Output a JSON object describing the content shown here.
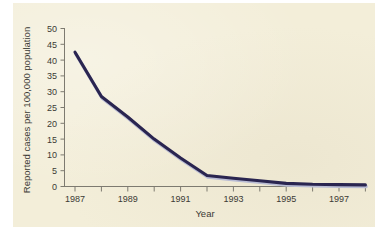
{
  "chart_data": {
    "type": "line",
    "title": "",
    "xlabel": "Year",
    "ylabel": "Reported cases per 100,000 population",
    "x": [
      1987,
      1988,
      1989,
      1990,
      1991,
      1992,
      1993,
      1994,
      1995,
      1996,
      1997,
      1998
    ],
    "values": [
      42.5,
      28.5,
      22.0,
      15.0,
      9.0,
      3.5,
      2.6,
      1.8,
      1.0,
      0.7,
      0.6,
      0.5
    ],
    "series": [
      {
        "name": "Reported cases",
        "values": [
          42.5,
          28.5,
          22.0,
          15.0,
          9.0,
          3.5,
          2.6,
          1.8,
          1.0,
          0.7,
          0.6,
          0.5
        ]
      }
    ],
    "xlim": [
      1987,
      1998
    ],
    "ylim": [
      0,
      50
    ],
    "ytick_labels": [
      "0",
      "5",
      "10",
      "15",
      "20",
      "25",
      "30",
      "35",
      "40",
      "45",
      "50"
    ],
    "ytick_values": [
      0,
      5,
      10,
      15,
      20,
      25,
      30,
      35,
      40,
      45,
      50
    ],
    "xtick_values": [
      1987,
      1988,
      1989,
      1990,
      1991,
      1992,
      1993,
      1994,
      1995,
      1996,
      1997,
      1998
    ],
    "xtick_labels": [
      "1987",
      "",
      "1989",
      "",
      "1991",
      "",
      "1993",
      "",
      "1995",
      "",
      "1997",
      ""
    ],
    "grid": false,
    "legend": false,
    "legend_position": "none",
    "line_color": "#2a2550",
    "background_color": "#f3eed9",
    "axis_color": "#7d7a70"
  }
}
